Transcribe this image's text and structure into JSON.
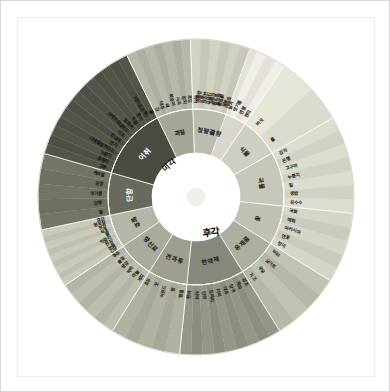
{
  "meta": {
    "center_main": "후각",
    "center_secondary": "미각",
    "background": "#ffffff",
    "plate_border": "#eceae6"
  },
  "hub": {
    "main_label": "후각",
    "taste_label": "미각"
  },
  "wheel": {
    "type": "sunburst",
    "rings": [
      "hub",
      "category",
      "descriptor"
    ],
    "sectors": [
      {
        "category": "곡향",
        "color": "#e8e6de",
        "start_deg": -90,
        "end_deg": -56,
        "descriptors": [
          "곡물향",
          "구수한",
          "누룽지",
          "볶은쌀",
          "숭늉",
          "쌀겨",
          "엿기름",
          "찐쌀",
          "현미"
        ]
      },
      {
        "category": "식물",
        "color": "#dedfd2",
        "start_deg": -56,
        "end_deg": -30,
        "descriptors": [
          "버섯",
          "풀"
        ]
      },
      {
        "category": "곡물",
        "color": "#d4d6c8",
        "start_deg": -30,
        "end_deg": 6,
        "descriptors": [
          "감자",
          "은행",
          "고구마",
          "누룽지",
          "밀",
          "생밤",
          "옥수수"
        ]
      },
      {
        "category": "꽃",
        "color": "#cdd0c0",
        "start_deg": 6,
        "end_deg": 32,
        "descriptors": [
          "국화",
          "매화",
          "아카시아",
          "연꽃",
          "장미"
        ]
      },
      {
        "category": "유제품",
        "color": "#b9bcab",
        "start_deg": 32,
        "end_deg": 58,
        "descriptors": [
          "버터",
          "요거트",
          "우유",
          "치즈"
        ]
      },
      {
        "category": "한약재",
        "color": "#8f9283",
        "start_deg": 58,
        "end_deg": 96,
        "descriptors": [
          "감초",
          "계피",
          "당귀",
          "대추",
          "더덕",
          "도라지",
          "인삼",
          "작약",
          "한약"
        ]
      },
      {
        "category": "견과류",
        "color": "#a9ab9c",
        "start_deg": 96,
        "end_deg": 122,
        "descriptors": [
          "땅콩",
          "밤",
          "아몬드",
          "잣",
          "호두"
        ]
      },
      {
        "category": "향신료",
        "color": "#b6b8a8",
        "start_deg": 122,
        "end_deg": 146,
        "descriptors": [
          "계피",
          "마늘",
          "박하",
          "생강",
          "솔잎",
          "후추"
        ]
      },
      {
        "category": "발효",
        "color": "#c2c4b4",
        "start_deg": 146,
        "end_deg": 168,
        "descriptors": [
          "간장",
          "누룩",
          "된장",
          "막걸리",
          "술",
          "식초",
          "젓갈",
          "청국장",
          "효모"
        ]
      },
      {
        "category": "단향",
        "color": "#6f7264",
        "start_deg": 168,
        "end_deg": 196,
        "descriptors": [
          "꿀",
          "단밤",
          "엿기름",
          "조청",
          "캐러멜"
        ]
      },
      {
        "category": "이취",
        "color": "#4f5246",
        "start_deg": 196,
        "end_deg": 244,
        "descriptors": [
          "고무",
          "곰팡이",
          "누룽지",
          "디에틸설파이드",
          "연지",
          "쉰내새",
          "식초",
          "아세트알데히드",
          "염화취",
          "유황",
          "종이",
          "지린내(은행)",
          "흙"
        ]
      },
      {
        "category": "과일",
        "color": "#b0b2a2",
        "start_deg": 244,
        "end_deg": 268,
        "descriptors": [
          "감",
          "대추",
          "배",
          "복숭아",
          "사과",
          "참외",
          "포도"
        ]
      },
      {
        "category": "청량감",
        "color": "#c9cbbb",
        "start_deg": 268,
        "end_deg": 290,
        "descriptors": [
          "박하",
          "솔잎",
          "시원한",
          "알코올",
          "에탄올",
          "청량한"
        ]
      }
    ]
  }
}
